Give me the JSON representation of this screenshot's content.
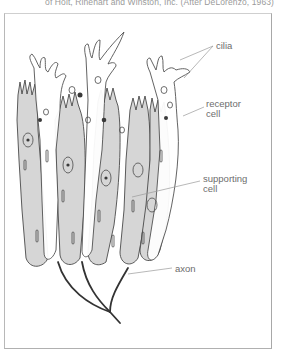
{
  "figure": {
    "caption_fragment": "of Holt, Rinehart and Winston, Inc. (After DeLorenzo, 1963)",
    "colors": {
      "supporting_cell_fill": "#d6d6d6",
      "receptor_cell_fill": "#ffffff",
      "outline": "#4a4a4a",
      "axon": "#333333",
      "leader_line": "#9a9a9a",
      "label_text": "#6d6d6d",
      "frame": "#b0b0b0"
    },
    "labels": {
      "cilia": "cilia",
      "receptor_cell_line1": "receptor",
      "receptor_cell_line2": "cell",
      "supporting_cell_line1": "supporting",
      "supporting_cell_line2": "cell",
      "axon": "axon"
    }
  }
}
